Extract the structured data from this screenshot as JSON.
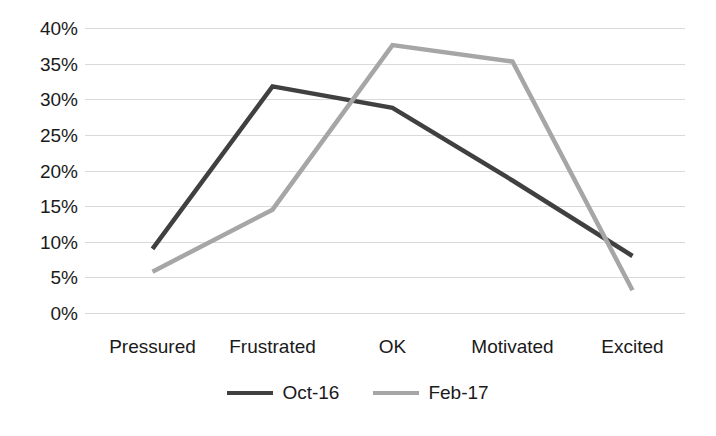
{
  "chart_data": {
    "type": "line",
    "title": "",
    "subtitle": "",
    "xlabel": "",
    "ylabel": "",
    "categories": [
      "Pressured",
      "Frustrated",
      "OK",
      "Motivated",
      "Excited"
    ],
    "series": [
      {
        "name": "Oct-16",
        "color": "#404040",
        "values": [
          9,
          31.8,
          28.8,
          18.6,
          8
        ]
      },
      {
        "name": "Feb-17",
        "color": "#a6a6a6",
        "values": [
          5.8,
          14.5,
          37.6,
          35.3,
          3.2
        ]
      }
    ],
    "ylim": [
      0,
      40
    ],
    "ytick_step": 5,
    "ytick_labels": [
      "40%",
      "35%",
      "30%",
      "25%",
      "20%",
      "15%",
      "10%",
      "5%",
      "0%"
    ],
    "ytick_values": [
      40,
      35,
      30,
      25,
      20,
      15,
      10,
      5,
      0
    ],
    "grid": true,
    "grid_color": "#d9d9d9",
    "legend_position": "bottom",
    "background": "#ffffff",
    "value_suffix": "%"
  }
}
